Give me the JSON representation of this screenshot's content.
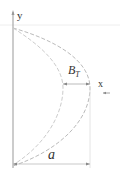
{
  "diagram": {
    "axes": {
      "y_label": "y",
      "x_label": "x"
    },
    "dimensions": {
      "inner_width_label": "B",
      "inner_width_subscript": "T",
      "total_width_label": "a"
    },
    "colors": {
      "axis": "#999999",
      "curve": "#bbbbbb",
      "text": "#333333"
    }
  }
}
